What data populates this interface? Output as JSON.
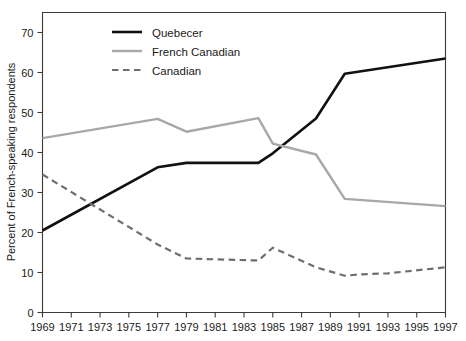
{
  "chart_data": {
    "type": "line",
    "title": "",
    "subtitle": "",
    "xlabel": "",
    "ylabel": "Percent of French-speaking respondents",
    "xlim": [
      1969,
      1997
    ],
    "ylim": [
      0,
      74
    ],
    "grid": false,
    "legend_position": "top-left-inside",
    "x_ticks": [
      1969,
      1971,
      1973,
      1975,
      1977,
      1979,
      1981,
      1983,
      1985,
      1987,
      1989,
      1991,
      1993,
      1995,
      1997
    ],
    "x_tick_labels": [
      "1969",
      "1971",
      "1973",
      "1975",
      "1977",
      "1979",
      "1981",
      "1983",
      "1985",
      "1987",
      "1989",
      "1991",
      "1993",
      "1995",
      "1997"
    ],
    "y_ticks": [
      0,
      10,
      20,
      30,
      40,
      50,
      60,
      70
    ],
    "y_tick_labels": [
      "0",
      "10",
      "20",
      "30",
      "40",
      "50",
      "60",
      "70"
    ],
    "series": [
      {
        "name": "Quebecer",
        "color": "#111111",
        "style": "solid",
        "width": 2.6,
        "x": [
          1969,
          1977,
          1979,
          1984,
          1985,
          1988,
          1990,
          1997
        ],
        "values": [
          20.5,
          36.3,
          37.4,
          37.4,
          39.8,
          48.5,
          59.7,
          63.5
        ]
      },
      {
        "name": "French Canadian",
        "color": "#a8a8a8",
        "style": "solid",
        "width": 2.4,
        "x": [
          1969,
          1977,
          1979,
          1984,
          1985,
          1988,
          1990,
          1997
        ],
        "values": [
          43.6,
          48.4,
          45.2,
          48.6,
          42.2,
          39.5,
          28.4,
          26.6
        ]
      },
      {
        "name": "Canadian",
        "color": "#6e6e6e",
        "style": "dashed",
        "width": 2.2,
        "x": [
          1969,
          1977,
          1979,
          1984,
          1985,
          1988,
          1990,
          1991,
          1993,
          1997
        ],
        "values": [
          34.5,
          17.0,
          13.5,
          13.0,
          16.2,
          11.3,
          9.2,
          9.5,
          9.8,
          11.3
        ]
      }
    ]
  },
  "legend": {
    "items": [
      {
        "label": "Quebecer"
      },
      {
        "label": "French Canadian"
      },
      {
        "label": "Canadian"
      }
    ]
  }
}
